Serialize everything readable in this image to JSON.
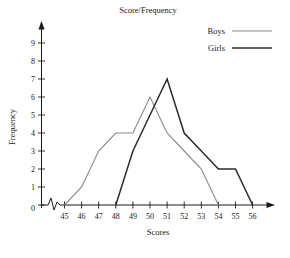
{
  "chart_data": {
    "type": "line",
    "title": "Score/Frequency",
    "xlabel": "Scores",
    "ylabel": "Frequency",
    "x": [
      45,
      46,
      47,
      48,
      49,
      50,
      51,
      52,
      53,
      54,
      55,
      56
    ],
    "xticklabels": [
      "45",
      "46",
      "47",
      "48",
      "49",
      "50",
      "51",
      "52",
      "53",
      "54",
      "55",
      "56"
    ],
    "yticklabels": [
      "0",
      "1",
      "2",
      "3",
      "4",
      "5",
      "6",
      "7",
      "8",
      "9"
    ],
    "xlim": [
      45,
      56
    ],
    "ylim": [
      0,
      9
    ],
    "grid": false,
    "legend_position": "top-right",
    "axis_break": "zigzag on x-axis between origin and 45",
    "series": [
      {
        "name": "Boys",
        "color": "#8a8a8a",
        "x": [
          45,
          46,
          47,
          48,
          49,
          50,
          51,
          52,
          53,
          54
        ],
        "values": [
          0,
          1,
          3,
          4,
          4,
          6,
          4,
          3,
          2,
          0
        ]
      },
      {
        "name": "Girls",
        "color": "#2b2b2b",
        "x": [
          48,
          49,
          50,
          51,
          52,
          53,
          54,
          55,
          56
        ],
        "values": [
          0,
          3,
          5,
          7,
          4,
          3,
          2,
          2,
          0
        ]
      }
    ]
  },
  "legend": {
    "entries": [
      {
        "label": "Boys"
      },
      {
        "label": "Girls"
      }
    ]
  },
  "axes": {
    "origin_label": "0"
  }
}
